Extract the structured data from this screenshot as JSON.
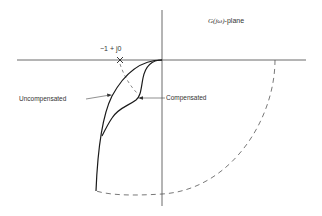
{
  "diagram": {
    "plane_label": {
      "italic": "G(jω)",
      "suffix": "-plane"
    },
    "critical_point_label": "−1 + j0",
    "curve_labels": {
      "uncompensated": "Uncompensated",
      "compensated": "Compensated"
    },
    "colors": {
      "curve": "#1a1a1a",
      "axis": "#444444",
      "dashed": "#555555",
      "text": "#333333"
    }
  }
}
